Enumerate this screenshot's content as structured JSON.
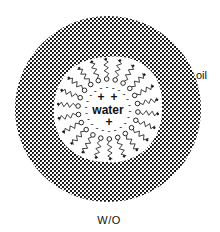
{
  "diagram": {
    "type": "reverse micelle schematic",
    "labels": {
      "outer_phase": "oil",
      "inner_core": "water",
      "caption": "W/O"
    },
    "core_charges": [
      "+",
      "+",
      "+"
    ],
    "interface_charges": "-",
    "surfactant": {
      "head_group": "open circle",
      "tail": "wavy line extending into oil",
      "count_approx": 22
    },
    "colors": {
      "oil_hatch": "#1a1a1a",
      "background": "#ffffff"
    }
  }
}
